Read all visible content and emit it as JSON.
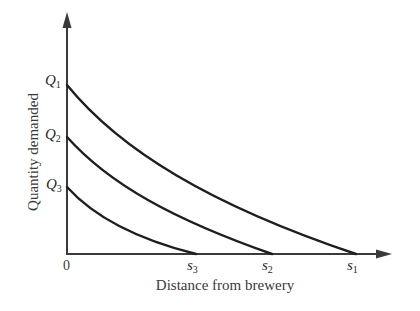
{
  "diagram": {
    "title": "",
    "y_axis_label": "Quantity demanded",
    "x_axis_label": "Distance from brewery",
    "origin_label": "0",
    "curves": [
      {
        "id": "curve-1",
        "intercept_label": {
          "main": "Q",
          "sub": "1"
        },
        "endpoint_label": {
          "main": "s",
          "sub": "1"
        }
      },
      {
        "id": "curve-2",
        "intercept_label": {
          "main": "Q",
          "sub": "2"
        },
        "endpoint_label": {
          "main": "s",
          "sub": "2"
        }
      },
      {
        "id": "curve-3",
        "intercept_label": {
          "main": "Q",
          "sub": "3"
        },
        "endpoint_label": {
          "main": "s",
          "sub": "3"
        }
      }
    ],
    "colors": {
      "axis": "#3a3a3a",
      "curve": "#1e1e1e",
      "background": "#ffffff"
    }
  }
}
